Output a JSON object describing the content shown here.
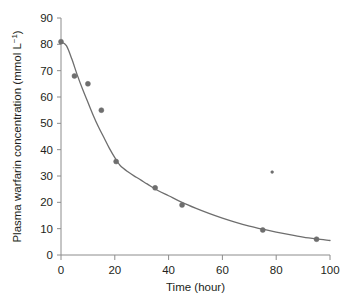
{
  "chart_data": {
    "type": "scatter",
    "title": "",
    "xlabel": "Time (hour)",
    "ylabel": "Plasma warfarin concentration (mmol L⁻¹)",
    "ylabel_main": "Plasma warfarin concentration (mmol L",
    "ylabel_sup": "−1",
    "ylabel_tail": ")",
    "xlim": [
      0,
      100
    ],
    "ylim": [
      0,
      90
    ],
    "xticks": [
      0,
      20,
      40,
      60,
      80,
      100
    ],
    "yticks": [
      0,
      10,
      20,
      30,
      40,
      50,
      60,
      70,
      80,
      90
    ],
    "xtick_labels": [
      "0",
      "20",
      "40",
      "60",
      "80",
      "100"
    ],
    "ytick_labels": [
      "0",
      "10",
      "20",
      "30",
      "40",
      "50",
      "60",
      "70",
      "80",
      "90"
    ],
    "grid": false,
    "legend": false,
    "marker_color": "#6e6e6e",
    "line_color": "#6e6e6e",
    "axis_color": "#8c8c8c",
    "background": "#ffffff",
    "series": [
      {
        "name": "Measured plasma warfarin concentration",
        "type": "scatter",
        "points": [
          {
            "x": 0.0,
            "y": 81.0
          },
          {
            "x": 5.0,
            "y": 68.0
          },
          {
            "x": 10.0,
            "y": 65.0
          },
          {
            "x": 15.0,
            "y": 55.0
          },
          {
            "x": 20.5,
            "y": 35.5
          },
          {
            "x": 35.0,
            "y": 25.5
          },
          {
            "x": 45.0,
            "y": 19.0
          },
          {
            "x": 75.0,
            "y": 9.5
          },
          {
            "x": 78.5,
            "y": 31.5
          },
          {
            "x": 95.0,
            "y": 6.0
          }
        ]
      },
      {
        "name": "Fitted decay curve",
        "type": "line",
        "points": [
          {
            "x": 0.0,
            "y": 81.0
          },
          {
            "x": 2.0,
            "y": 79.5
          },
          {
            "x": 4.0,
            "y": 74.5
          },
          {
            "x": 6.0,
            "y": 68.5
          },
          {
            "x": 8.0,
            "y": 63.0
          },
          {
            "x": 10.0,
            "y": 58.0
          },
          {
            "x": 12.0,
            "y": 53.0
          },
          {
            "x": 14.0,
            "y": 48.5
          },
          {
            "x": 16.0,
            "y": 44.5
          },
          {
            "x": 18.0,
            "y": 40.5
          },
          {
            "x": 20.0,
            "y": 37.0
          },
          {
            "x": 22.0,
            "y": 34.0
          },
          {
            "x": 25.0,
            "y": 31.5
          },
          {
            "x": 28.0,
            "y": 29.5
          },
          {
            "x": 32.0,
            "y": 27.0
          },
          {
            "x": 36.0,
            "y": 24.5
          },
          {
            "x": 40.0,
            "y": 22.5
          },
          {
            "x": 45.0,
            "y": 20.0
          },
          {
            "x": 50.0,
            "y": 17.8
          },
          {
            "x": 55.0,
            "y": 15.8
          },
          {
            "x": 60.0,
            "y": 14.0
          },
          {
            "x": 65.0,
            "y": 12.4
          },
          {
            "x": 70.0,
            "y": 11.0
          },
          {
            "x": 75.0,
            "y": 9.8
          },
          {
            "x": 80.0,
            "y": 8.7
          },
          {
            "x": 85.0,
            "y": 7.7
          },
          {
            "x": 90.0,
            "y": 6.8
          },
          {
            "x": 95.0,
            "y": 6.1
          },
          {
            "x": 100.0,
            "y": 5.5
          }
        ]
      }
    ]
  }
}
